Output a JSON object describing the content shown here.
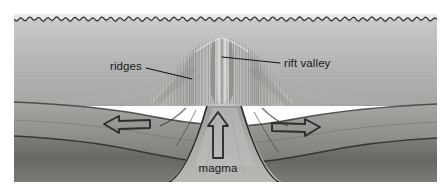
{
  "figure": {
    "type": "geological-cross-section",
    "style": "grayscale pencil illustration",
    "canvas": {
      "width": 443,
      "height": 193
    },
    "plate_bounds": {
      "x": 14,
      "y": 14,
      "width": 423,
      "height": 168
    },
    "background_color": "#ffffff"
  },
  "labels": {
    "ridges": {
      "text": "ridges",
      "x": 110,
      "y": 70,
      "anchor": "start",
      "leader": {
        "x1": 146,
        "y1": 68,
        "x2": 192,
        "y2": 79
      }
    },
    "rift_valley": {
      "text": "rift valley",
      "x": 284,
      "y": 67,
      "anchor": "start",
      "leader": {
        "x1": 280,
        "y1": 63,
        "x2": 222,
        "y2": 57
      }
    },
    "magma": {
      "text": "magma",
      "x": 218,
      "y": 172,
      "anchor": "middle",
      "leader": null
    }
  },
  "arrows": {
    "left_spreading": {
      "name": "left-spreading-arrow",
      "direction": "left",
      "tip_x": 104,
      "tail_x": 150,
      "y": 124
    },
    "right_spreading": {
      "name": "right-spreading-arrow",
      "direction": "right",
      "tip_x": 320,
      "tail_x": 272,
      "y": 127
    },
    "magma_upwelling": {
      "name": "magma-upwelling-arrow",
      "direction": "up",
      "x": 218,
      "tip_y": 112,
      "tail_y": 158
    }
  },
  "features": {
    "water_surface": {
      "name": "ocean-surface-wavy-line",
      "y": 19,
      "wave_amplitude": 1.6,
      "wave_period": 9
    },
    "water_column": {
      "top": 14,
      "bottom": 104,
      "tone": "#b9b9b7"
    },
    "ridge_crest": {
      "center_x": 222,
      "peak_y": 38,
      "half_width": 72
    },
    "rift_notch": {
      "center_x": 222,
      "depth": 12
    },
    "crust_layer": {
      "tone": "#8b8b88"
    },
    "mantle_layer": {
      "tone": "#6d6d6a"
    },
    "magma_chamber": {
      "center_x": 222,
      "tone": "#a5a5a2"
    }
  },
  "colors": {
    "ink": "#1a1a1a",
    "arrow_stroke": "#2e2e2e",
    "water_light": "#c6c6c4",
    "water_dark": "#a8a8a6",
    "crust_light": "#9a9a97",
    "crust_dark": "#6a6a67",
    "mantle_dark": "#555552",
    "paper": "#ffffff"
  }
}
